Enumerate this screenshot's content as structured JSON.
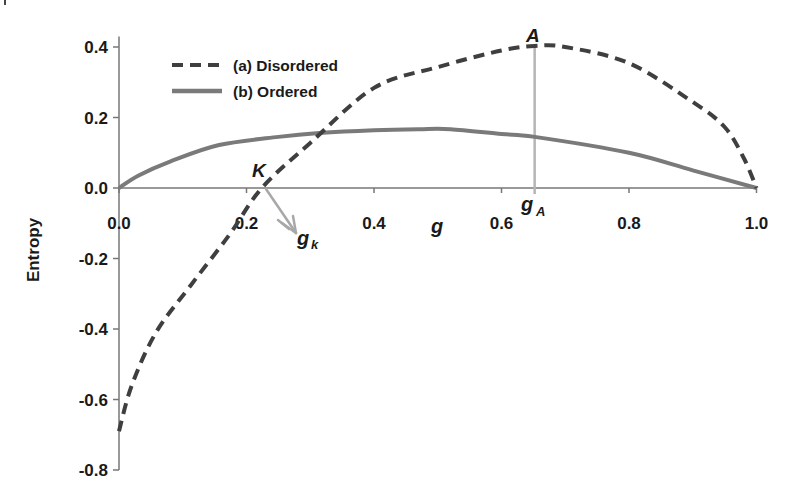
{
  "chart_data": {
    "type": "line",
    "title": "",
    "xlabel": "g",
    "ylabel": "Entropy",
    "xlim": [
      0.0,
      1.0
    ],
    "ylim": [
      -0.8,
      0.45
    ],
    "grid": false,
    "legend_position": "upper-left",
    "x_ticks": [
      "0.0",
      "0.2",
      "0.4",
      "0.6",
      "0.8",
      "1.0"
    ],
    "y_ticks": [
      "0.4",
      "0.2",
      "0.0",
      "-0.2",
      "-0.4",
      "-0.6",
      "-0.8"
    ],
    "series": [
      {
        "name": "(a) Disordered",
        "style": "dashed",
        "color": "#3f3f3f",
        "x": [
          0.0,
          0.02,
          0.058,
          0.113,
          0.173,
          0.224,
          0.3,
          0.4,
          0.5,
          0.6,
          0.652,
          0.7,
          0.8,
          0.9,
          0.95,
          0.98,
          1.0
        ],
        "y": [
          -0.69,
          -0.56,
          -0.41,
          -0.275,
          -0.133,
          0.0,
          0.128,
          0.284,
          0.343,
          0.39,
          0.403,
          0.4,
          0.354,
          0.244,
          0.173,
          0.085,
          0.0
        ]
      },
      {
        "name": "(b) Ordered",
        "style": "solid",
        "color": "#7a7a7a",
        "x": [
          0.0,
          0.03,
          0.08,
          0.157,
          0.25,
          0.314,
          0.4,
          0.47,
          0.52,
          0.6,
          0.652,
          0.8,
          0.9,
          1.0
        ],
        "y": [
          0.0,
          0.035,
          0.075,
          0.122,
          0.145,
          0.156,
          0.164,
          0.167,
          0.167,
          0.153,
          0.145,
          0.1,
          0.05,
          0.0
        ]
      }
    ],
    "annotations": [
      {
        "label": "A",
        "x": 0.652,
        "y": 0.403,
        "note": "maximum of disordered curve, vertical line down to x-axis"
      },
      {
        "label": "K",
        "x": 0.224,
        "y": 0.0,
        "note": "zero crossing of disordered curve"
      },
      {
        "label": "g",
        "sub": "A",
        "x": 0.652,
        "note": "x-axis marker below A"
      },
      {
        "label": "g",
        "sub": "k",
        "x": 0.224,
        "note": "arrow from K pointing to label"
      }
    ]
  },
  "labels": {
    "xlabel": "g",
    "ylabel": "Entropy",
    "legend_a": "(a) Disordered",
    "legend_b": "(b) Ordered",
    "point_A": "A",
    "point_K": "K",
    "gA_main": "g",
    "gA_sub": "A",
    "gk_main": "g",
    "gk_sub": "k"
  }
}
